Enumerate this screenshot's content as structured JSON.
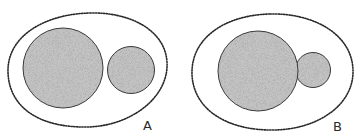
{
  "figure": {
    "colors": {
      "background": "#ffffff",
      "outline": "#2a2a2a",
      "stipple_fill": "#c4c4c4",
      "stipple_dot": "#6a6a6a"
    },
    "panels": [
      {
        "label": "A",
        "envelope": {
          "shape": "egg",
          "style": "dotted"
        },
        "bodies": [
          {
            "name": "large-sphere",
            "cx": 63,
            "cy": 68,
            "r": 40
          },
          {
            "name": "small-sphere",
            "cx": 131,
            "cy": 70,
            "r": 23.5
          }
        ],
        "relation": "separate (spheres just touch)"
      },
      {
        "label": "B",
        "envelope": {
          "shape": "egg",
          "style": "dotted"
        },
        "bodies": [
          {
            "name": "large-sphere",
            "cx": 258,
            "cy": 71,
            "r": 40
          },
          {
            "name": "small-sphere",
            "cx": 313,
            "cy": 70,
            "r": 17.5
          }
        ],
        "relation": "overlapping (small sphere partly merged)"
      }
    ]
  }
}
